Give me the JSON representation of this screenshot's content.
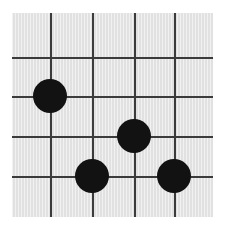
{
  "figure": {
    "type": "grid-board-diagram",
    "background_color": "#ffffff",
    "board": {
      "fill_color": "#e1e1e1",
      "x": 12,
      "y": 13,
      "width": 201,
      "height": 204
    },
    "grid": {
      "line_color": "#3b3b3b",
      "line_width": 2,
      "vertical_line_positions": [
        38,
        80,
        122,
        162
      ],
      "horizontal_line_positions": [
        44,
        83,
        123,
        163
      ],
      "vertical_line_count": 4,
      "horizontal_line_count": 4
    },
    "stones": [
      {
        "label": "stone-1",
        "color": "#121212",
        "cx": 38,
        "cy": 83,
        "r": 17,
        "column": 1,
        "row": 2
      },
      {
        "label": "stone-2",
        "color": "#121212",
        "cx": 122,
        "cy": 123,
        "r": 17,
        "column": 3,
        "row": 3
      },
      {
        "label": "stone-3",
        "color": "#121212",
        "cx": 80,
        "cy": 163,
        "r": 17,
        "column": 2,
        "row": 4
      },
      {
        "label": "stone-4",
        "color": "#121212",
        "cx": 162,
        "cy": 163,
        "r": 17,
        "column": 4,
        "row": 4
      }
    ],
    "stone_count": 4
  }
}
